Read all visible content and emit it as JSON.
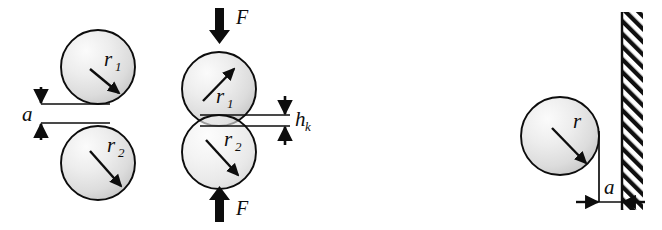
{
  "figure": {
    "background_color": "#ffffff",
    "line_color": "#0d0d0d",
    "sphere_fill_light": "#f2f2f2",
    "sphere_fill_mid": "#d8d8d8",
    "sphere_fill_edge": "#c2c2c2",
    "hatch_color": "#0d0d0d",
    "width": 662,
    "height": 230
  },
  "panels": {
    "left": {
      "name": "two-spheres-separated",
      "gap_label": "a",
      "upper_sphere": {
        "radius_label": "r",
        "radius_subscript": "1",
        "arrow_direction": "down-right"
      },
      "lower_sphere": {
        "radius_label": "r",
        "radius_subscript": "2",
        "arrow_direction": "down-right"
      }
    },
    "middle": {
      "name": "two-spheres-compressed",
      "overlap_label": "h",
      "overlap_subscript": "k",
      "force_top_label": "F",
      "force_bottom_label": "F",
      "force_top_direction": "down",
      "force_bottom_direction": "up",
      "upper_sphere": {
        "radius_label": "r",
        "radius_subscript": "1",
        "arrow_direction": "up-right"
      },
      "lower_sphere": {
        "radius_label": "r",
        "radius_subscript": "2",
        "arrow_direction": "down-right"
      }
    },
    "right": {
      "name": "sphere-near-wall",
      "gap_label": "a",
      "sphere": {
        "radius_label": "r",
        "radius_subscript": "",
        "arrow_direction": "down-right"
      },
      "wall": {
        "name": "hatched-wall",
        "hatch_direction": "lower-left-to-upper-right"
      }
    }
  }
}
